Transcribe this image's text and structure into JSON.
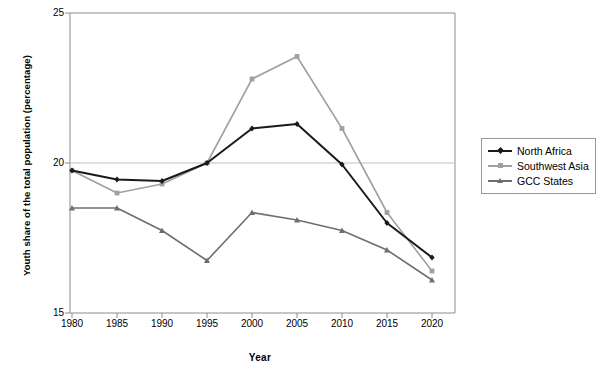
{
  "chart_data": {
    "type": "line",
    "title": "",
    "xlabel": "Year",
    "ylabel": "Youth share of the total population (percentage)",
    "categories": [
      1980,
      1985,
      1990,
      1995,
      2000,
      2005,
      2010,
      2015,
      2020
    ],
    "x": [
      1980,
      1985,
      1990,
      1995,
      2000,
      2005,
      2010,
      2015,
      2020
    ],
    "xlim": [
      1978,
      2022
    ],
    "ylim": [
      15,
      25
    ],
    "yticks": [
      15,
      20,
      25
    ],
    "xticks": [
      1980,
      1985,
      1990,
      1995,
      2000,
      2005,
      2010,
      2015,
      2020
    ],
    "grid": "horizontal",
    "legend_position": "right",
    "series": [
      {
        "name": "North Africa",
        "color": "#1a1a1a",
        "marker": "diamond",
        "values": [
          19.75,
          19.45,
          19.4,
          20.0,
          21.15,
          21.3,
          19.95,
          18.0,
          16.85
        ]
      },
      {
        "name": "Southwest Asia",
        "color": "#a0a0a0",
        "marker": "square",
        "values": [
          19.75,
          19.0,
          19.3,
          20.0,
          22.8,
          23.55,
          21.15,
          18.35,
          16.4
        ]
      },
      {
        "name": "GCC States",
        "color": "#6e6e6e",
        "marker": "triangle",
        "values": [
          18.5,
          18.5,
          17.75,
          16.75,
          18.35,
          18.1,
          17.75,
          17.1,
          16.1
        ]
      }
    ]
  },
  "axes": {
    "y_title": "Youth share of the total population (percentage)",
    "x_title": "Year",
    "ytick_labels": [
      "25",
      "20",
      "15"
    ],
    "xtick_labels": [
      "1980",
      "1985",
      "1990",
      "1995",
      "2000",
      "2005",
      "2010",
      "2015",
      "2020"
    ]
  },
  "legend": {
    "items": [
      {
        "label": "North Africa"
      },
      {
        "label": "Southwest Asia"
      },
      {
        "label": "GCC States"
      }
    ]
  },
  "colors": {
    "north_africa": "#1a1a1a",
    "southwest_asia": "#a0a0a0",
    "gcc_states": "#6e6e6e",
    "grid": "#bfbfbf",
    "axis": "#8c8c8c",
    "background": "#ffffff"
  }
}
